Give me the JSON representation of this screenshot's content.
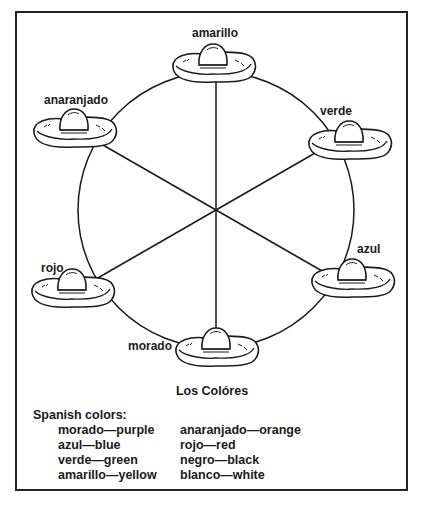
{
  "diagram": {
    "title": "Los Colóres",
    "center_labels": [
      {
        "id": "amarillo",
        "label": "amarillo"
      },
      {
        "id": "verde",
        "label": "verde"
      },
      {
        "id": "azul",
        "label": "azul"
      },
      {
        "id": "morado",
        "label": "morado"
      },
      {
        "id": "rojo",
        "label": "rojo"
      },
      {
        "id": "anaranjado",
        "label": "anaranjado"
      }
    ]
  },
  "legend": {
    "heading": "Spanish colors:",
    "left": [
      {
        "text": "morado—purple"
      },
      {
        "text": "azul—blue"
      },
      {
        "text": "verde—green"
      },
      {
        "text": "amarillo—yellow"
      }
    ],
    "right": [
      {
        "text": "anaranjado—orange"
      },
      {
        "text": "rojo—red"
      },
      {
        "text": "negro—black"
      },
      {
        "text": "blanco—white"
      }
    ]
  },
  "icons": {
    "hat": "sombrero-icon"
  },
  "colors": {
    "ink": "#1a1a1a",
    "paper": "#ffffff"
  }
}
